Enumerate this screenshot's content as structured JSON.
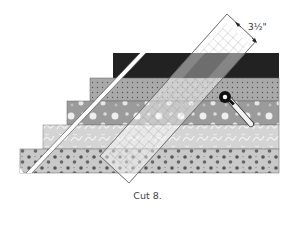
{
  "figure": {
    "caption": "Cut 8.",
    "measurement_label": "3½\"",
    "strips": [
      {
        "name": "black",
        "fill": "#1e1e1e",
        "pattern": "solid"
      },
      {
        "name": "dotted-gray",
        "fill": "#a8a8a8",
        "pattern": "small-dots"
      },
      {
        "name": "circles-gray",
        "fill": "#9a9a9a",
        "pattern": "circles"
      },
      {
        "name": "swirl-light",
        "fill": "#d6d6d6",
        "pattern": "swirls"
      },
      {
        "name": "dots-light",
        "fill": "#c8c8c8",
        "pattern": "large-dots"
      }
    ],
    "tools": [
      "ruler",
      "rotary-cutter"
    ]
  }
}
